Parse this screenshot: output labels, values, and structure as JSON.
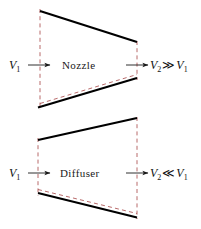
{
  "figure": {
    "background": "#ffffff",
    "wall_color": "#000000",
    "dashed_color": "#b05a5a",
    "arrow_color": "#1a1a1a",
    "width": 201,
    "height": 229
  },
  "diagrams": [
    {
      "id": "nozzle",
      "name": "Nozzle",
      "label": "Nozzle",
      "inlet": {
        "velocity_symbol": "V",
        "velocity_subscript": "1",
        "arrow": "right-arrow"
      },
      "outlet": {
        "velocity_symbol": "V",
        "velocity_subscript": "2",
        "arrow": "right-arrow",
        "relation": "≫",
        "relation_name": "much-greater-than",
        "compare_symbol": "V",
        "compare_subscript": "1",
        "expression": "V2 ≫ V1"
      },
      "geometry": {
        "shape": "converging",
        "top_wall": [
          [
            40,
            11
          ],
          [
            137,
            42
          ]
        ],
        "bottom_wall": [
          [
            38,
            107
          ],
          [
            137,
            78
          ]
        ],
        "inlet_dash": [
          [
            40,
            11
          ],
          [
            40,
            107
          ]
        ],
        "outlet_dash": [
          [
            137,
            42
          ],
          [
            137,
            78
          ]
        ],
        "inner_dash": [
          [
            40,
            104
          ],
          [
            137,
            75
          ]
        ]
      }
    },
    {
      "id": "diffuser",
      "name": "Diffuser",
      "label": "Diffuser",
      "inlet": {
        "velocity_symbol": "V",
        "velocity_subscript": "1",
        "arrow": "right-arrow"
      },
      "outlet": {
        "velocity_symbol": "V",
        "velocity_subscript": "2",
        "arrow": "right-arrow",
        "relation": "≪",
        "relation_name": "much-less-than",
        "compare_symbol": "V",
        "compare_subscript": "1",
        "expression": "V2 ≪ V1"
      },
      "geometry": {
        "shape": "diverging",
        "top_wall": [
          [
            38,
            140
          ],
          [
            137,
            118
          ]
        ],
        "bottom_wall": [
          [
            38,
            193
          ],
          [
            137,
            217
          ]
        ],
        "inlet_dash": [
          [
            38,
            140
          ],
          [
            38,
            193
          ]
        ],
        "outlet_dash": [
          [
            137,
            118
          ],
          [
            137,
            217
          ]
        ],
        "inner_dash": [
          [
            38,
            190
          ],
          [
            137,
            214
          ]
        ]
      }
    }
  ]
}
